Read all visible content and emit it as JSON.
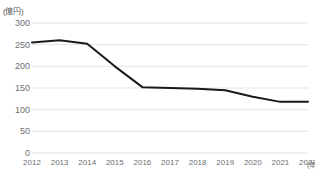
{
  "chart_data": {
    "type": "line",
    "title": "",
    "subtitle": "",
    "xlabel": "(年)",
    "ylabel": "(億円)",
    "categories": [
      "2012",
      "2013",
      "2014",
      "2015",
      "2016",
      "2017",
      "2018",
      "2019",
      "2020",
      "2021",
      "2022"
    ],
    "x": [
      2012,
      2013,
      2014,
      2015,
      2016,
      2017,
      2018,
      2019,
      2020,
      2021,
      2022
    ],
    "values": [
      255,
      260,
      252,
      200,
      152,
      150,
      148,
      145,
      130,
      118,
      118
    ],
    "series": [
      {
        "name": "",
        "values": [
          255,
          260,
          252,
          200,
          152,
          150,
          148,
          145,
          130,
          118,
          118
        ]
      }
    ],
    "ylim": [
      0,
      300
    ],
    "y_ticks": [
      0,
      50,
      100,
      150,
      200,
      250,
      300
    ],
    "y_tick_labels": [
      "0",
      "50",
      "100",
      "150",
      "200",
      "250",
      "300"
    ],
    "grid": true,
    "grid_axis": "y",
    "legend": false,
    "legend_position": "none",
    "markers": false,
    "line_color": "#1a1a1a",
    "grid_color": "#e3e3e3",
    "tick_label_color": "#6e6e70",
    "background_color": "#ffffff",
    "annotations": []
  },
  "axis": {
    "unit_y": "(億円)",
    "unit_x": "(年)"
  }
}
